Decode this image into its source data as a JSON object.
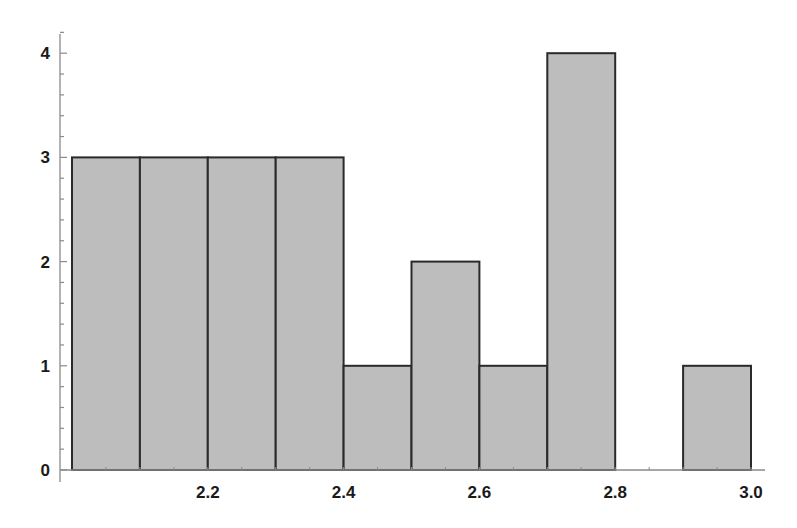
{
  "chart_data": {
    "type": "bar",
    "subtype": "histogram",
    "title": "",
    "xlabel": "",
    "ylabel": "",
    "bin_width": 0.1,
    "bins": [
      {
        "start": 2.0,
        "end": 2.1,
        "count": 3
      },
      {
        "start": 2.1,
        "end": 2.2,
        "count": 3
      },
      {
        "start": 2.2,
        "end": 2.3,
        "count": 3
      },
      {
        "start": 2.3,
        "end": 2.4,
        "count": 3
      },
      {
        "start": 2.4,
        "end": 2.5,
        "count": 1
      },
      {
        "start": 2.5,
        "end": 2.6,
        "count": 2
      },
      {
        "start": 2.6,
        "end": 2.7,
        "count": 1
      },
      {
        "start": 2.7,
        "end": 2.8,
        "count": 4
      },
      {
        "start": 2.8,
        "end": 2.9,
        "count": 0
      },
      {
        "start": 2.9,
        "end": 3.0,
        "count": 1
      }
    ],
    "categories": [
      "2.0-2.1",
      "2.1-2.2",
      "2.2-2.3",
      "2.3-2.4",
      "2.4-2.5",
      "2.5-2.6",
      "2.6-2.7",
      "2.7-2.8",
      "2.8-2.9",
      "2.9-3.0"
    ],
    "values": [
      3,
      3,
      3,
      3,
      1,
      2,
      1,
      4,
      0,
      1
    ],
    "x_ticks": [
      "2.2",
      "2.4",
      "2.6",
      "2.8",
      "3.0"
    ],
    "y_ticks": [
      "0",
      "1",
      "2",
      "3",
      "4"
    ],
    "xlim": [
      2.0,
      3.0
    ],
    "ylim": [
      0,
      4.3
    ],
    "grid": false,
    "legend": null,
    "colors": {
      "bar_fill": "#bdbdbd",
      "bar_edge": "#2a2a2a",
      "axis": "#8a8a8a"
    }
  }
}
